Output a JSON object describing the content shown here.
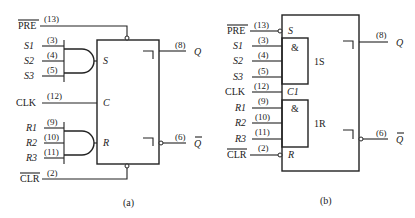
{
  "diagram_a": {
    "caption": "(a)",
    "preset": {
      "label": "PRE",
      "pin": "(13)"
    },
    "set_inputs": [
      {
        "label": "S1",
        "pin": "(3)"
      },
      {
        "label": "S2",
        "pin": "(4)"
      },
      {
        "label": "S3",
        "pin": "(5)"
      }
    ],
    "clock": {
      "label": "CLK",
      "pin": "(12)"
    },
    "reset_inputs": [
      {
        "label": "R1",
        "pin": "(9)"
      },
      {
        "label": "R2",
        "pin": "(10)"
      },
      {
        "label": "R3",
        "pin": "(11)"
      }
    ],
    "clear": {
      "label": "CLR",
      "pin": "(2)"
    },
    "box_labels": {
      "s": "S",
      "c": "C",
      "r": "R"
    },
    "outputs": [
      {
        "label": "Q",
        "pin": "(8)"
      },
      {
        "label": "Q",
        "pin": "(6)",
        "inverted": true
      }
    ]
  },
  "diagram_b": {
    "caption": "(b)",
    "preset": {
      "label": "PRE",
      "pin": "(13)",
      "box_label": "S"
    },
    "set_inputs": [
      {
        "label": "S1",
        "pin": "(3)"
      },
      {
        "label": "S2",
        "pin": "(4)"
      },
      {
        "label": "S3",
        "pin": "(5)"
      }
    ],
    "and_symbol": "&",
    "set_block_label": "1S",
    "clock": {
      "label": "CLK",
      "pin": "(12)",
      "box_label": "C1"
    },
    "reset_inputs": [
      {
        "label": "R1",
        "pin": "(9)"
      },
      {
        "label": "R2",
        "pin": "(10)"
      },
      {
        "label": "R3",
        "pin": "(11)"
      }
    ],
    "reset_block_label": "1R",
    "clear": {
      "label": "CLR",
      "pin": "(2)",
      "box_label": "R"
    },
    "outputs": [
      {
        "label": "Q",
        "pin": "(8)"
      },
      {
        "label": "Q",
        "pin": "(6)",
        "inverted": true
      }
    ]
  }
}
